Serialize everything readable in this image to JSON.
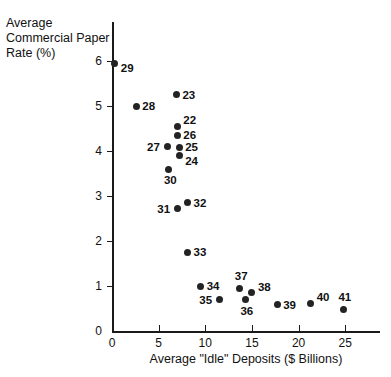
{
  "chart_data": {
    "type": "scatter",
    "title": "",
    "xlabel": "Average \"Idle\" Deposits ($ Billions)",
    "ylabel": "Average Commercial Paper Rate (%)",
    "xlim": [
      0,
      28.5
    ],
    "ylim": [
      0,
      6.6
    ],
    "xticks": [
      0,
      5,
      10,
      15,
      20,
      25
    ],
    "xticklabels": [
      "0",
      "5",
      "10",
      "15",
      "20",
      "25"
    ],
    "yticks": [
      0,
      1,
      2,
      3,
      4,
      5,
      6
    ],
    "yticklabels": [
      "0",
      "1",
      "2",
      "3",
      "4",
      "5",
      "6"
    ],
    "grid": false,
    "legend": null,
    "marker": "filled-circle",
    "marker_color": "#232323",
    "points": [
      {
        "label": "29",
        "x": 0.3,
        "y": 5.95,
        "label_pos": "right-below"
      },
      {
        "label": "28",
        "x": 2.6,
        "y": 5.0,
        "label_pos": "right"
      },
      {
        "label": "23",
        "x": 6.9,
        "y": 5.25,
        "label_pos": "right"
      },
      {
        "label": "22",
        "x": 7.0,
        "y": 4.55,
        "label_pos": "right-above"
      },
      {
        "label": "26",
        "x": 7.0,
        "y": 4.35,
        "label_pos": "right"
      },
      {
        "label": "27",
        "x": 5.9,
        "y": 4.1,
        "label_pos": "left"
      },
      {
        "label": "25",
        "x": 7.2,
        "y": 4.08,
        "label_pos": "right"
      },
      {
        "label": "24",
        "x": 7.2,
        "y": 3.9,
        "label_pos": "right-below"
      },
      {
        "label": "30",
        "x": 6.1,
        "y": 3.6,
        "label_pos": "below"
      },
      {
        "label": "31",
        "x": 7.0,
        "y": 2.72,
        "label_pos": "left"
      },
      {
        "label": "32",
        "x": 8.1,
        "y": 2.85,
        "label_pos": "right"
      },
      {
        "label": "33",
        "x": 8.1,
        "y": 1.75,
        "label_pos": "right"
      },
      {
        "label": "34",
        "x": 9.5,
        "y": 1.0,
        "label_pos": "right"
      },
      {
        "label": "35",
        "x": 11.5,
        "y": 0.7,
        "label_pos": "left"
      },
      {
        "label": "37",
        "x": 13.7,
        "y": 0.95,
        "label_pos": "above"
      },
      {
        "label": "38",
        "x": 15.0,
        "y": 0.85,
        "label_pos": "right-above"
      },
      {
        "label": "36",
        "x": 14.3,
        "y": 0.7,
        "label_pos": "below"
      },
      {
        "label": "39",
        "x": 17.7,
        "y": 0.58,
        "label_pos": "right"
      },
      {
        "label": "40",
        "x": 21.3,
        "y": 0.62,
        "label_pos": "right-above"
      },
      {
        "label": "41",
        "x": 24.8,
        "y": 0.48,
        "label_pos": "above"
      }
    ]
  }
}
